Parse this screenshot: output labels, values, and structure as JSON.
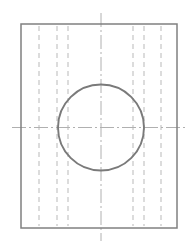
{
  "canvas": {
    "width": 194,
    "height": 246,
    "background": "#ffffff",
    "title": "Plate with central circular hole — orthographic view"
  },
  "palette": {
    "outline": "#808080",
    "circle": "#7a7a7a",
    "hidden_line": "#b9b9b9",
    "center_line": "#b0b0b0",
    "background": "#ffffff"
  },
  "geometry": {
    "plate": {
      "name": "plate-outline",
      "shape": "rectangle",
      "x": 21,
      "y": 24,
      "width": 156,
      "height": 204,
      "stroke": "#808080",
      "stroke_width": 1.5,
      "fill": "none"
    },
    "hole": {
      "name": "circular-hole",
      "shape": "circle",
      "cx": 101,
      "cy": 127.5,
      "r": 43,
      "stroke": "#7a7a7a",
      "stroke_width": 1.9,
      "fill": "none"
    },
    "center_lines": [
      {
        "name": "vertical-center-line",
        "orientation": "vertical",
        "x": 101,
        "y1": 13,
        "y2": 241,
        "stroke": "#b0b0b0",
        "stroke_width": 1,
        "dash": "14,3,2,3"
      },
      {
        "name": "horizontal-center-line",
        "orientation": "horizontal",
        "y": 127.5,
        "x1": 12,
        "x2": 187,
        "stroke": "#b0b0b0",
        "stroke_width": 1,
        "dash": "14,3,2,3"
      }
    ],
    "hidden_lines": {
      "stroke": "#b9b9b9",
      "stroke_width": 1,
      "dash": "5,4",
      "y1": 26,
      "y2": 226,
      "left_group": [
        39,
        57,
        68
      ],
      "right_group": [
        133,
        144,
        161
      ]
    }
  },
  "labels": {
    "view_type": "front view",
    "feature_count": "1 hole",
    "hidden_edge_count": "6 hidden edges"
  }
}
